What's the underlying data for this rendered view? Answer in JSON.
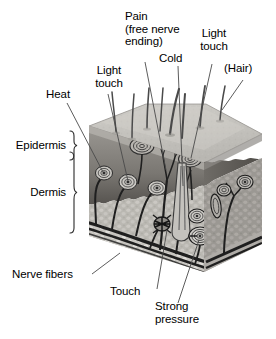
{
  "figure": {
    "background_color": "#ffffff",
    "width": 276,
    "height": 339
  },
  "layer_labels": [
    {
      "id": "epidermis",
      "text": "Epidermis"
    },
    {
      "id": "dermis",
      "text": "Dermis"
    }
  ],
  "receptor_labels": {
    "heat": "Heat",
    "light_touch_left": "Light\ntouch",
    "pain": "Pain\n(free nerve\nending)",
    "cold": "Cold",
    "light_touch_right": "Light\ntouch",
    "hair": "(Hair)",
    "nerve_fibers": "Nerve fibers",
    "touch": "Touch",
    "strong_pressure": "Strong\npressure"
  },
  "colors": {
    "text": "#000000",
    "leader_line": "#3a3a3a",
    "bracket": "#2b2b2b",
    "epidermis_top": "#b9b7b2",
    "epidermis_top_light": "#cfcdc8",
    "epidermis_band": "#8e8b86",
    "epidermis_band_dark": "#6d6a66",
    "dermis_fill": "#b5b3ad",
    "dermis_side": "#9a9791",
    "subcutaneous": "#cdcbc6",
    "nerve": "#1d1d1d",
    "hair_shaft": "#4a4a4a",
    "corpuscle_ring": "#333333"
  }
}
